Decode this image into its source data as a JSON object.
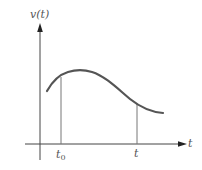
{
  "diagram": {
    "title": "",
    "y_axis": {
      "label": "v(t)"
    },
    "x_axis": {
      "label": "t"
    },
    "markers": [
      {
        "name": "t0",
        "label_base": "t",
        "label_sub": "0"
      },
      {
        "name": "t",
        "label_base": "t"
      }
    ],
    "curve": {
      "description": "smooth curve rising to a maximum shortly after t0 then decaying and flattening past t",
      "color": "#555555"
    },
    "colors": {
      "axis": "#444444",
      "curve": "#555555",
      "marker_lines": "#777777",
      "background": "#ffffff"
    }
  }
}
